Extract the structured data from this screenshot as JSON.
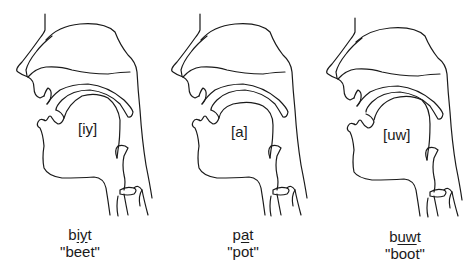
{
  "figures": [
    {
      "vowel_label": "[iy]",
      "transcription": {
        "before": "b",
        "underlined": "iy",
        "after": "t"
      },
      "gloss": "\"beet\""
    },
    {
      "vowel_label": "[a]",
      "transcription": {
        "before": "p",
        "underlined": "a",
        "after": "t"
      },
      "gloss": "\"pot\""
    },
    {
      "vowel_label": "[uw]",
      "transcription": {
        "before": "b",
        "underlined": "uw",
        "after": "t"
      },
      "gloss": "\"boot\""
    }
  ],
  "colors": {
    "line": "#1a1a1a",
    "background": "#ffffff"
  }
}
